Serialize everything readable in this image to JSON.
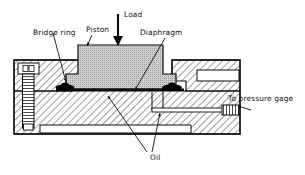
{
  "figure": {
    "kind": "engineering-cross-section-diagram",
    "background_color": "#ffffff",
    "line_color": "#0d0d0d",
    "hatch_color": "#1a1a1a",
    "piston_fill_color": "#c8c8c8",
    "seal_color": "#000000",
    "cavity_fill_color": "#ffffff"
  },
  "labels": {
    "bridge_ring": "Bridge ring",
    "piston": "Piston",
    "load": "Load",
    "diaphragm": "Diaphragm",
    "pressure_gage": "To pressure gage",
    "oil": "Oil"
  },
  "components": [
    {
      "id": "bridge-ring",
      "label": "Bridge ring"
    },
    {
      "id": "piston",
      "label": "Piston"
    },
    {
      "id": "load-arrow",
      "label": "Load"
    },
    {
      "id": "diaphragm",
      "label": "Diaphragm"
    },
    {
      "id": "pressure-gage-port",
      "label": "To pressure gage"
    },
    {
      "id": "oil-chamber",
      "label": "Oil"
    },
    {
      "id": "bolt",
      "label": ""
    },
    {
      "id": "body",
      "label": ""
    }
  ]
}
